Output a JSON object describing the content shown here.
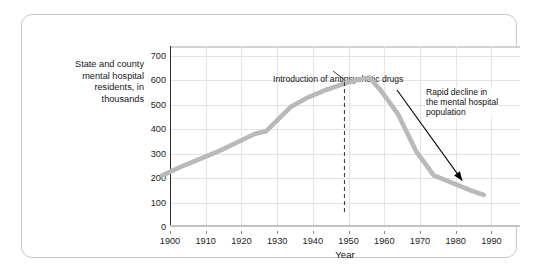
{
  "figure": {
    "y_axis_title": "State and county\nmental hospital\nresidents, in\nthousands",
    "x_axis_title": "Year"
  },
  "annotations": {
    "drugs": "Introduction of antipsychotic drugs",
    "decline": "Rapid decline in\nthe mental hospital\npopulation"
  },
  "colors": {
    "series_line": "#b9b9b9",
    "gridline": "#e3e3e3",
    "axis": "#2b2b2b",
    "frame": "#c9c9c9",
    "text": "#111111",
    "annotation_arrow": "#000000"
  },
  "chart_data": {
    "type": "line",
    "title": "",
    "xlabel": "Year",
    "ylabel": "State and county mental hospital residents, in thousands",
    "xlim": [
      1900,
      1998
    ],
    "ylim": [
      0,
      740
    ],
    "xticks": [
      1900,
      1910,
      1920,
      1930,
      1940,
      1950,
      1960,
      1970,
      1980,
      1990
    ],
    "yticks": [
      0,
      100,
      200,
      300,
      400,
      500,
      600,
      700
    ],
    "grid": true,
    "legend": "none",
    "series": [
      {
        "name": "State and county mental hospital residents",
        "x": [
          1904,
          1910,
          1920,
          1930,
          1933,
          1940,
          1945,
          1950,
          1955,
          1960,
          1962,
          1965,
          1970,
          1975,
          1980,
          1985,
          1990,
          1994
        ],
        "values": [
          150,
          190,
          250,
          320,
          330,
          430,
          470,
          500,
          525,
          545,
          550,
          500,
          400,
          250,
          150,
          120,
          90,
          70
        ]
      }
    ],
    "annotations": [
      {
        "text": "Introduction of antipsychotic drugs",
        "type": "dashed-vline-callout",
        "x": 1955
      },
      {
        "text": "Rapid decline in the mental hospital population",
        "type": "arrow-callout",
        "points_to_x": 1988,
        "points_to_y": 125
      }
    ]
  }
}
